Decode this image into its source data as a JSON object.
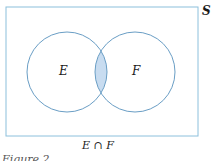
{
  "diagram": {
    "universe_label": "S",
    "set_a_label": "E",
    "set_b_label": "F",
    "shaded_region": "E ∩ F",
    "caption": "E ∩ F",
    "figure_label": "Figure 2",
    "colors": {
      "outline": "#7fb3d5",
      "circle": "#6a9ec5",
      "fill": "#c8dcf0"
    }
  }
}
